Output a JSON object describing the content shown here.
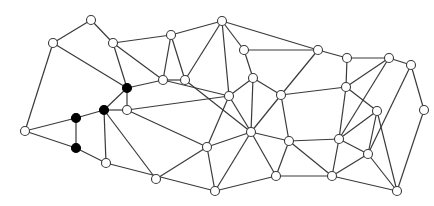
{
  "diagram": {
    "type": "planar-graph",
    "node_radius": 4.5,
    "colors": {
      "edge": "#3a3a3a",
      "node_fill_default": "#ffffff",
      "node_fill_highlight": "#000000"
    },
    "nodes": [
      {
        "id": "n1",
        "x": 53,
        "y": 43,
        "highlight": false
      },
      {
        "id": "n2",
        "x": 91,
        "y": 20,
        "highlight": false
      },
      {
        "id": "n3",
        "x": 113,
        "y": 43,
        "highlight": false
      },
      {
        "id": "n4",
        "x": 127,
        "y": 88,
        "highlight": true
      },
      {
        "id": "n5",
        "x": 104,
        "y": 110,
        "highlight": true
      },
      {
        "id": "n6",
        "x": 127,
        "y": 110,
        "highlight": false
      },
      {
        "id": "n7",
        "x": 76,
        "y": 118,
        "highlight": true
      },
      {
        "id": "n8",
        "x": 76,
        "y": 148,
        "highlight": true
      },
      {
        "id": "n9",
        "x": 25,
        "y": 131,
        "highlight": false
      },
      {
        "id": "n10",
        "x": 106,
        "y": 163,
        "highlight": false
      },
      {
        "id": "n11",
        "x": 156,
        "y": 179,
        "highlight": false
      },
      {
        "id": "n12",
        "x": 215,
        "y": 191,
        "highlight": false
      },
      {
        "id": "n13",
        "x": 163,
        "y": 80,
        "highlight": false
      },
      {
        "id": "n14",
        "x": 171,
        "y": 35,
        "highlight": false
      },
      {
        "id": "n15",
        "x": 185,
        "y": 80,
        "highlight": false
      },
      {
        "id": "n16",
        "x": 222,
        "y": 21,
        "highlight": false
      },
      {
        "id": "n17",
        "x": 244,
        "y": 50,
        "highlight": false
      },
      {
        "id": "n18",
        "x": 229,
        "y": 96,
        "highlight": false
      },
      {
        "id": "n19",
        "x": 251,
        "y": 132,
        "highlight": false
      },
      {
        "id": "n20",
        "x": 207,
        "y": 147,
        "highlight": false
      },
      {
        "id": "n21",
        "x": 281,
        "y": 95,
        "highlight": false
      },
      {
        "id": "n22",
        "x": 318,
        "y": 50,
        "highlight": false
      },
      {
        "id": "n23",
        "x": 347,
        "y": 58,
        "highlight": false
      },
      {
        "id": "n24",
        "x": 389,
        "y": 58,
        "highlight": false
      },
      {
        "id": "n25",
        "x": 411,
        "y": 65,
        "highlight": false
      },
      {
        "id": "n26",
        "x": 346,
        "y": 87,
        "highlight": false
      },
      {
        "id": "n27",
        "x": 377,
        "y": 111,
        "highlight": false
      },
      {
        "id": "n28",
        "x": 289,
        "y": 141,
        "highlight": false
      },
      {
        "id": "n29",
        "x": 339,
        "y": 139,
        "highlight": false
      },
      {
        "id": "n30",
        "x": 368,
        "y": 154,
        "highlight": false
      },
      {
        "id": "n31",
        "x": 332,
        "y": 176,
        "highlight": false
      },
      {
        "id": "n32",
        "x": 397,
        "y": 191,
        "highlight": false
      },
      {
        "id": "n33",
        "x": 253,
        "y": 78,
        "highlight": false
      },
      {
        "id": "n34",
        "x": 276,
        "y": 176,
        "highlight": false
      },
      {
        "id": "n35",
        "x": 424,
        "y": 110,
        "highlight": false
      }
    ],
    "edges": [
      [
        "n1",
        "n2"
      ],
      [
        "n2",
        "n3"
      ],
      [
        "n1",
        "n9"
      ],
      [
        "n1",
        "n4"
      ],
      [
        "n3",
        "n4"
      ],
      [
        "n3",
        "n13"
      ],
      [
        "n3",
        "n14"
      ],
      [
        "n4",
        "n5"
      ],
      [
        "n4",
        "n6"
      ],
      [
        "n4",
        "n13"
      ],
      [
        "n5",
        "n6"
      ],
      [
        "n5",
        "n7"
      ],
      [
        "n5",
        "n10"
      ],
      [
        "n5",
        "n11"
      ],
      [
        "n7",
        "n8"
      ],
      [
        "n7",
        "n9"
      ],
      [
        "n8",
        "n9"
      ],
      [
        "n8",
        "n10"
      ],
      [
        "n10",
        "n12"
      ],
      [
        "n6",
        "n18"
      ],
      [
        "n6",
        "n20"
      ],
      [
        "n13",
        "n14"
      ],
      [
        "n13",
        "n15"
      ],
      [
        "n13",
        "n18"
      ],
      [
        "n14",
        "n15"
      ],
      [
        "n14",
        "n16"
      ],
      [
        "n15",
        "n16"
      ],
      [
        "n15",
        "n19"
      ],
      [
        "n16",
        "n17"
      ],
      [
        "n16",
        "n18"
      ],
      [
        "n16",
        "n22"
      ],
      [
        "n17",
        "n33"
      ],
      [
        "n17",
        "n22"
      ],
      [
        "n18",
        "n33"
      ],
      [
        "n18",
        "n20"
      ],
      [
        "n18",
        "n19"
      ],
      [
        "n20",
        "n11"
      ],
      [
        "n20",
        "n12"
      ],
      [
        "n20",
        "n19"
      ],
      [
        "n19",
        "n12"
      ],
      [
        "n19",
        "n33"
      ],
      [
        "n19",
        "n28"
      ],
      [
        "n19",
        "n34"
      ],
      [
        "n33",
        "n21"
      ],
      [
        "n21",
        "n22"
      ],
      [
        "n21",
        "n26"
      ],
      [
        "n21",
        "n28"
      ],
      [
        "n21",
        "n19"
      ],
      [
        "n22",
        "n23"
      ],
      [
        "n23",
        "n26"
      ],
      [
        "n23",
        "n24"
      ],
      [
        "n24",
        "n25"
      ],
      [
        "n24",
        "n29"
      ],
      [
        "n25",
        "n30"
      ],
      [
        "n25",
        "n35"
      ],
      [
        "n26",
        "n27"
      ],
      [
        "n26",
        "n29"
      ],
      [
        "n26",
        "n24"
      ],
      [
        "n27",
        "n29"
      ],
      [
        "n27",
        "n30"
      ],
      [
        "n35",
        "n32"
      ],
      [
        "n28",
        "n29"
      ],
      [
        "n28",
        "n34"
      ],
      [
        "n29",
        "n30"
      ],
      [
        "n29",
        "n31"
      ],
      [
        "n30",
        "n31"
      ],
      [
        "n30",
        "n32"
      ],
      [
        "n27",
        "n32"
      ],
      [
        "n31",
        "n32"
      ],
      [
        "n31",
        "n34"
      ],
      [
        "n34",
        "n12"
      ],
      [
        "n28",
        "n31"
      ]
    ]
  }
}
